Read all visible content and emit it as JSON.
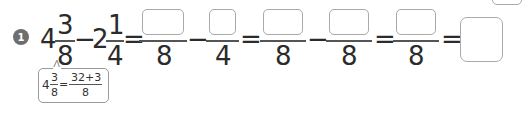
{
  "problem": {
    "number": "1",
    "term1": {
      "whole": "4",
      "numerator": "3",
      "denominator": "8"
    },
    "minus1": "−",
    "term2": {
      "whole": "2",
      "numerator": "1",
      "denominator": "4"
    },
    "equals": "=",
    "step1": {
      "left_denominator": "8",
      "right_denominator": "4",
      "operator": "−"
    },
    "step2": {
      "left_denominator": "8",
      "right_denominator": "8",
      "operator": "−"
    },
    "step3": {
      "denominator": "8"
    },
    "answer_box": ""
  },
  "hint": {
    "whole": "4",
    "numerator": "3",
    "denominator": "8",
    "equals": "=",
    "result_numerator": "32+3",
    "result_denominator": "8"
  }
}
